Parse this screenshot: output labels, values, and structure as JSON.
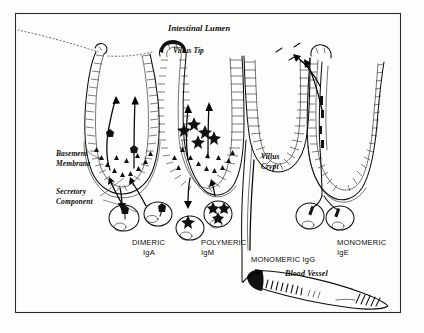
{
  "figure": {
    "background_color": "#fdfdfb",
    "ink_color": "#111111",
    "border_color": "#2b2b2b",
    "title": "Intestinal Lumen"
  },
  "labels": {
    "intestinal_lumen": "Intestinal Lumen",
    "villus_tip": "Villus Tip",
    "basement_membrane_line1": "Basement",
    "basement_membrane_line2": "Membrane",
    "secretory_component_line1": "Secretory",
    "secretory_component_line2": "Component",
    "villus_crypt_line1": "Villus",
    "villus_crypt_line2": "Crypt",
    "dimeric_iga_line1": "DIMERIC",
    "dimeric_iga_line2": "IgA",
    "polymeric_igm_line1": "POLYMERIC",
    "polymeric_igm_line2": "IgM",
    "monomeric_igg": "MONOMERIC IgG",
    "monomeric_ige_line1": "MONOMERIC",
    "monomeric_ige_line2": "IgE",
    "blood_vessel": "Blood Vessel"
  },
  "diagram_elements": {
    "villi_count": 4,
    "plasma_cell_count": 6,
    "antibody_symbols": [
      "triangle-secretory-component",
      "star-polymeric-igm",
      "bar-monomeric-ige"
    ]
  }
}
